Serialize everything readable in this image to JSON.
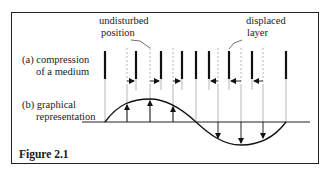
{
  "figure": {
    "caption": "Figure 2.1",
    "labels": {
      "undisturbed_line1": "undisturbed",
      "undisturbed_line2": "position",
      "displaced_line1": "displaced",
      "displaced_line2": "layer",
      "a_line1": "(a) compression",
      "a_line2": "of a medium",
      "b_line1": "(b) graphical",
      "b_line2": "representation"
    },
    "undisturbed_positions_x": [
      105,
      127,
      150,
      173,
      196,
      218,
      241,
      263,
      286
    ],
    "displaced_layers_x": [
      105,
      136,
      161,
      182,
      196,
      209,
      229,
      252,
      286
    ],
    "displacement_directions": [
      "none",
      "right",
      "right",
      "right",
      "none",
      "left",
      "left",
      "left",
      "none"
    ],
    "graph": {
      "baseline_y": 122,
      "peak_y": 99,
      "trough_y": 145,
      "shape": "one full sine wave: positive half then negative half"
    }
  }
}
